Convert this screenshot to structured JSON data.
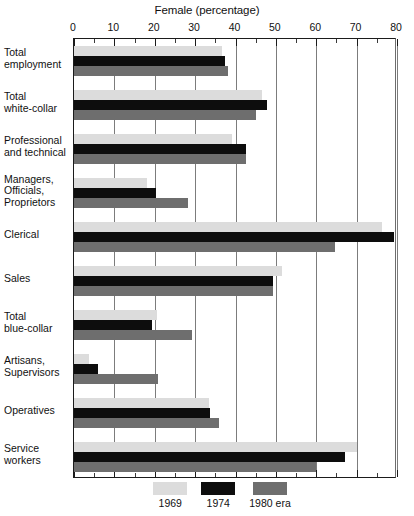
{
  "chart_data": {
    "type": "bar",
    "orientation": "horizontal",
    "title": "Female (percentage)",
    "xlabel": "Female (percentage)",
    "ylabel": "",
    "xlim": [
      0,
      80
    ],
    "xticks": [
      0,
      10,
      20,
      30,
      40,
      50,
      60,
      70,
      80
    ],
    "xtick_labels": [
      "0",
      "10",
      "20",
      "30",
      "40",
      "50",
      "60",
      "70",
      "80"
    ],
    "minor_tick_interval": 5,
    "grid": "vertical major gridlines",
    "legend_position": "bottom-center",
    "categories": [
      "Total employment",
      "Total white-collar",
      "Professional and technical",
      "Managers, Officials, Proprietors",
      "Clerical",
      "Sales",
      "Total blue-collar",
      "Artisans, Supervisors",
      "Operatives",
      "Service workers"
    ],
    "category_lines": [
      [
        "Total",
        "employment"
      ],
      [
        "Total",
        "white-collar"
      ],
      [
        "Professional",
        "and technical"
      ],
      [
        "Managers,",
        "Officials,",
        "Proprietors"
      ],
      [
        "Clerical"
      ],
      [
        "Sales"
      ],
      [
        "Total",
        "blue-collar"
      ],
      [
        "Artisans,",
        "Supervisors"
      ],
      [
        "Operatives"
      ],
      [
        "Service",
        "workers"
      ]
    ],
    "series": [
      {
        "name": "1969",
        "color": "#dcdcdc",
        "values": [
          36.6,
          46.5,
          39.2,
          18.2,
          76.2,
          51.5,
          20.5,
          3.7,
          33.4,
          70.0
        ]
      },
      {
        "name": "1974",
        "color": "#0d0d0d",
        "values": [
          37.5,
          47.8,
          42.6,
          20.3,
          79.2,
          49.3,
          19.3,
          5.9,
          33.7,
          67.1
        ]
      },
      {
        "name": "1980 era",
        "color": "#6e6e6e",
        "values": [
          38.1,
          45.1,
          42.6,
          28.2,
          64.6,
          49.3,
          29.3,
          20.9,
          36.0,
          59.9
        ]
      }
    ]
  },
  "legend": {
    "items": [
      {
        "label": "1969",
        "swatch": "s0"
      },
      {
        "label": "1974",
        "swatch": "s1"
      },
      {
        "label": "1980 era",
        "swatch": "s2"
      }
    ]
  }
}
